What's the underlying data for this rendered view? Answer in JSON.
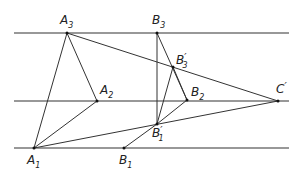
{
  "diagram": {
    "stroke_color": "#333333",
    "parallel_lines": [
      {
        "id": "top",
        "y": 33,
        "x1": 14,
        "x2": 289
      },
      {
        "id": "middle",
        "y": 101,
        "x1": 14,
        "x2": 289
      },
      {
        "id": "bottom",
        "y": 148,
        "x1": 14,
        "x2": 289
      }
    ],
    "points": {
      "A3": {
        "x": 67,
        "y": 33,
        "label": "A",
        "sub": "3",
        "prime": "",
        "lx": 60,
        "ly": 24
      },
      "A2": {
        "x": 97,
        "y": 101,
        "label": "A",
        "sub": "2",
        "prime": "",
        "lx": 100,
        "ly": 94
      },
      "A1": {
        "x": 34,
        "y": 148,
        "label": "A",
        "sub": "1",
        "prime": "",
        "lx": 27,
        "ly": 164
      },
      "B3": {
        "x": 157,
        "y": 33,
        "label": "B",
        "sub": "3",
        "prime": "",
        "lx": 152,
        "ly": 24
      },
      "B3p": {
        "x": 173,
        "y": 67,
        "label": "B",
        "sub": "3",
        "prime": "′",
        "lx": 176,
        "ly": 64
      },
      "B2": {
        "x": 187,
        "y": 100,
        "label": "B",
        "sub": "2",
        "prime": "",
        "lx": 191,
        "ly": 96
      },
      "B1p": {
        "x": 157,
        "y": 124,
        "label": "B",
        "sub": "1",
        "prime": "′",
        "lx": 152,
        "ly": 137
      },
      "B1": {
        "x": 124,
        "y": 148,
        "label": "B",
        "sub": "1",
        "prime": "",
        "lx": 119,
        "ly": 164
      },
      "Cp": {
        "x": 278,
        "y": 101,
        "label": "C",
        "sub": "",
        "prime": "′",
        "lx": 276,
        "ly": 93
      }
    },
    "segments": [
      [
        "A3",
        "A1"
      ],
      [
        "A3",
        "A2"
      ],
      [
        "A2",
        "A1"
      ],
      [
        "A3",
        "Cp"
      ],
      [
        "A1",
        "Cp"
      ],
      [
        "B3",
        "B1p"
      ],
      [
        "B3",
        "B2"
      ],
      [
        "B3p",
        "B2"
      ],
      [
        "B3p",
        "B1p"
      ],
      [
        "B2",
        "B1p"
      ],
      [
        "B1",
        "B1p"
      ]
    ]
  }
}
